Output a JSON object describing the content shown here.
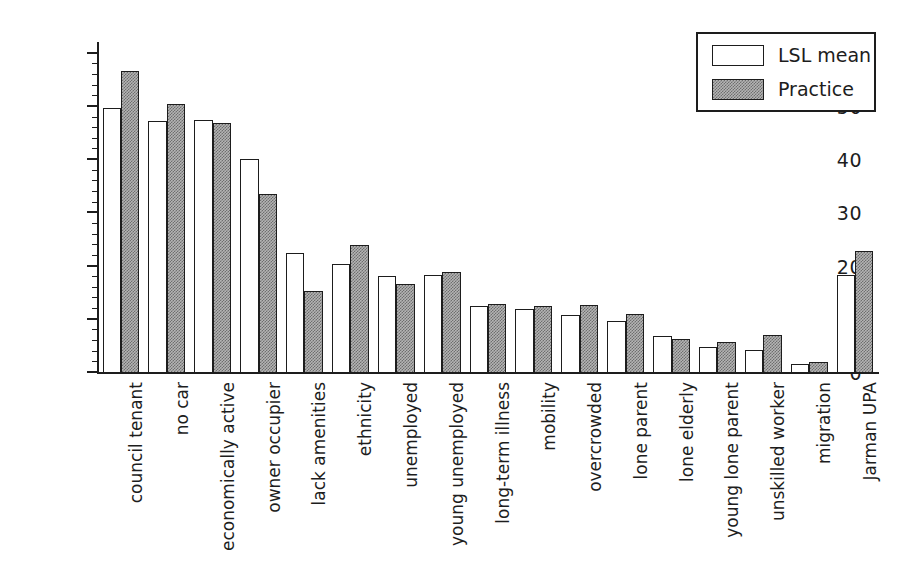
{
  "chart_data": {
    "type": "bar",
    "title": "",
    "xlabel": "",
    "ylabel": "% of population",
    "ylim": [
      0,
      62
    ],
    "ytick_labels": [
      "0",
      "10",
      "20",
      "30",
      "40",
      "50",
      "60"
    ],
    "ytick_values": [
      0,
      10,
      20,
      30,
      40,
      50,
      60
    ],
    "minor_tick_interval": 2,
    "grid": false,
    "legend_position": "top-right",
    "categories": [
      "council tenant",
      "no car",
      "economically active",
      "owner occupier",
      "lack amenities",
      "ethnicity",
      "unemployed",
      "young unemployed",
      "long-term illness",
      "mobility",
      "overcrowded",
      "lone parent",
      "lone elderly",
      "young lone parent",
      "unskilled worker",
      "migration",
      "Jarman UPA"
    ],
    "series": [
      {
        "name": "LSL mean",
        "color": "#ffffff",
        "values": [
          49.7,
          47.4,
          47.5,
          40.3,
          22.6,
          20.4,
          18.2,
          18.4,
          12.6,
          12.0,
          10.9,
          9.7,
          6.9,
          4.8,
          4.4,
          1.6,
          18.5
        ]
      },
      {
        "name": "Practice",
        "color": "#b4b4b4",
        "values": [
          56.8,
          50.5,
          47.0,
          33.6,
          15.4,
          24.0,
          16.8,
          18.9,
          13.0,
          12.6,
          12.8,
          11.1,
          6.4,
          5.8,
          7.2,
          2.1,
          23.0
        ]
      }
    ]
  },
  "legend": {
    "entries": [
      {
        "label": "LSL mean",
        "swatch": "white-rect-swatch"
      },
      {
        "label": "Practice",
        "swatch": "gray-hatched-rect-swatch"
      }
    ]
  }
}
